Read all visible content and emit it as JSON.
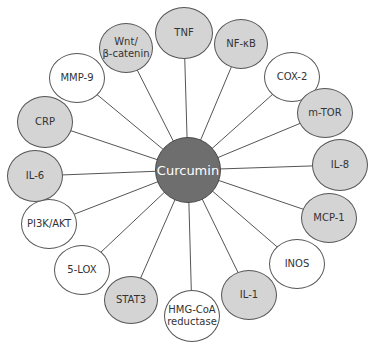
{
  "diagram": {
    "center": {
      "label": "Curcumin",
      "x": 188,
      "y": 170,
      "r": 33,
      "color": "#6e6e6e"
    },
    "colors": {
      "gray_node": "#d4d4d4",
      "white_node": "#ffffff",
      "line": "#555555"
    },
    "nodes": [
      {
        "id": "tnf",
        "label": "TNF",
        "fill": "gray",
        "x": 184,
        "y": 33,
        "rx": 29,
        "ry": 26
      },
      {
        "id": "nf-kb",
        "label": "NF-κB",
        "fill": "gray",
        "x": 241,
        "y": 44,
        "rx": 27,
        "ry": 25
      },
      {
        "id": "cox-2",
        "label": "COX-2",
        "fill": "white",
        "x": 292,
        "y": 77,
        "rx": 28,
        "ry": 25
      },
      {
        "id": "m-tor",
        "label": "m-TOR",
        "fill": "gray",
        "x": 325,
        "y": 113,
        "rx": 28,
        "ry": 25
      },
      {
        "id": "il-8",
        "label": "IL-8",
        "fill": "gray",
        "x": 340,
        "y": 165,
        "rx": 28,
        "ry": 26
      },
      {
        "id": "mcp-1",
        "label": "MCP-1",
        "fill": "gray",
        "x": 329,
        "y": 218,
        "rx": 28,
        "ry": 25
      },
      {
        "id": "inos",
        "label": "INOS",
        "fill": "white",
        "x": 297,
        "y": 264,
        "rx": 28,
        "ry": 25
      },
      {
        "id": "il-1",
        "label": "IL-1",
        "fill": "gray",
        "x": 249,
        "y": 295,
        "rx": 28,
        "ry": 25
      },
      {
        "id": "hmg-coa",
        "label": "HMG-CoA\nreductase",
        "fill": "white",
        "x": 192,
        "y": 316,
        "rx": 28,
        "ry": 26
      },
      {
        "id": "stat3",
        "label": "STAT3",
        "fill": "gray",
        "x": 131,
        "y": 300,
        "rx": 27,
        "ry": 24
      },
      {
        "id": "5-lox",
        "label": "5-LOX",
        "fill": "white",
        "x": 82,
        "y": 270,
        "rx": 28,
        "ry": 25
      },
      {
        "id": "pi3k-akt",
        "label": "PI3K/AKT",
        "fill": "white",
        "x": 49,
        "y": 224,
        "rx": 28,
        "ry": 25
      },
      {
        "id": "il-6",
        "label": "IL-6",
        "fill": "gray",
        "x": 35,
        "y": 176,
        "rx": 28,
        "ry": 26
      },
      {
        "id": "crp",
        "label": "CRP",
        "fill": "gray",
        "x": 45,
        "y": 122,
        "rx": 28,
        "ry": 26
      },
      {
        "id": "mmp-9",
        "label": "MMP-9",
        "fill": "white",
        "x": 77,
        "y": 78,
        "rx": 28,
        "ry": 25
      },
      {
        "id": "wnt",
        "label": "Wnt/\nβ-catenin",
        "fill": "gray",
        "x": 126,
        "y": 48,
        "rx": 27,
        "ry": 25
      }
    ]
  }
}
